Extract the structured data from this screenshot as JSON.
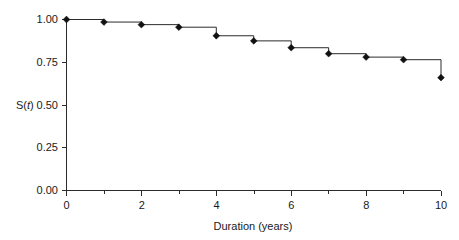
{
  "chart_data": {
    "type": "line",
    "subtype": "kaplan-meier-step",
    "title": "",
    "xlabel": "Duration (years)",
    "ylabel": "S(t)",
    "ylabel_parts": {
      "prefix": "S(",
      "italic": "t",
      "suffix": ")"
    },
    "x": [
      0,
      1,
      2,
      3,
      4,
      5,
      6,
      7,
      8,
      9,
      10
    ],
    "values": [
      1.0,
      0.985,
      0.97,
      0.955,
      0.905,
      0.875,
      0.835,
      0.8,
      0.78,
      0.765,
      0.66
    ],
    "series": [
      {
        "name": "S(t)",
        "values": [
          1.0,
          0.985,
          0.97,
          0.955,
          0.905,
          0.875,
          0.835,
          0.8,
          0.78,
          0.765,
          0.66
        ]
      }
    ],
    "xlim": [
      0,
      10
    ],
    "ylim": [
      0.0,
      1.0
    ],
    "xticks": [
      0,
      2,
      4,
      6,
      8,
      10
    ],
    "xtick_labels": [
      "0",
      "2",
      "4",
      "6",
      "8",
      "10"
    ],
    "xminorticks": [
      1,
      3,
      5,
      7,
      9
    ],
    "yticks": [
      0.0,
      0.25,
      0.5,
      0.75,
      1.0
    ],
    "ytick_labels": [
      "0.00",
      "0.25",
      "0.50",
      "0.75",
      "1.00"
    ],
    "grid": false,
    "legend": null,
    "marker": "diamond",
    "line_color": "#2b2b2b",
    "marker_color": "#111111",
    "background_color": "#ffffff"
  },
  "axes": {
    "x_title": "Duration (years)",
    "y_title": "S(t)"
  }
}
